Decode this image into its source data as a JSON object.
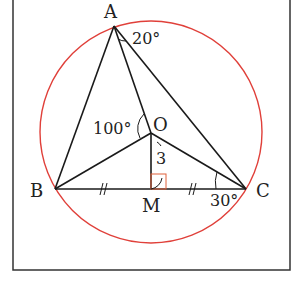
{
  "diagram": {
    "type": "geometry",
    "colors": {
      "stroke": "#1a1a1a",
      "circle": "#e0403a",
      "right_angle_mark": "#e0603a",
      "frame": "#333333"
    },
    "points": {
      "A": {
        "label": "A",
        "x": 114,
        "y": 26
      },
      "B": {
        "label": "B",
        "x": 55,
        "y": 189
      },
      "C": {
        "label": "C",
        "x": 246,
        "y": 189
      },
      "O": {
        "label": "O",
        "x": 151,
        "y": 133
      },
      "M": {
        "label": "M",
        "x": 151,
        "y": 189
      }
    },
    "circle": {
      "cx": 151,
      "cy": 132,
      "r": 111
    },
    "segments": [
      "AB",
      "AC",
      "AO",
      "BO",
      "CO",
      "OM",
      "BC"
    ],
    "annotations": {
      "angle_OAC": "20°",
      "angle_AOB": "100°",
      "angle_OCB": "30°",
      "length_OM": "3",
      "tick_BM": "//",
      "tick_MC": "//"
    }
  }
}
